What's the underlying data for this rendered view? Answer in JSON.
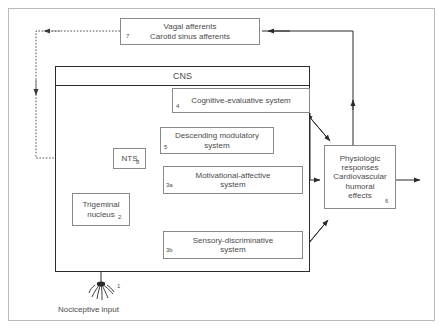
{
  "diagram": {
    "frame_color": "#b9b9b9",
    "cns_border_color": "#2b2b2b",
    "box_border_color": "#8a8a8a",
    "text_color": "#4a4a4a",
    "solid_line_color": "#2b2b2b",
    "dotted_line_color": "#555555",
    "dashed_gray_color": "#9a9a9a"
  },
  "cns": {
    "label": "CNS"
  },
  "boxes": {
    "afferents": {
      "line1": "Vagal afferents",
      "line2": "Carotid sinus afferents",
      "number": "7"
    },
    "cognitive": {
      "label": "Cognitive-evaluative system",
      "number": "4"
    },
    "descending": {
      "line1": "Descending modulatory",
      "line2": "system",
      "number": "5"
    },
    "nts": {
      "label": "NTS",
      "number": "8"
    },
    "motivational": {
      "line1": "Motivational-affective",
      "line2": "system",
      "number": "3a"
    },
    "sensory": {
      "line1": "Sensory-discriminative",
      "line2": "system",
      "number": "3b"
    },
    "trigeminal": {
      "line1": "Trigeminal",
      "line2": "nucleus",
      "number": "2"
    },
    "physiologic": {
      "line1": "Physiologic",
      "line2": "responses",
      "line3": "Cardiovascular",
      "line4": "humoral",
      "line5": "effects",
      "number": "6"
    }
  },
  "nociceptive": {
    "caption": "Nociceptive input",
    "number": "1",
    "icon": "nerve-ending-icon"
  }
}
